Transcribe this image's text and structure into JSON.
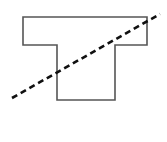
{
  "diagram": {
    "type": "geometry",
    "shape": {
      "name": "T-shape",
      "points": "23,17 147,17 147,45 115,45 115,100 57,100 57,45 23,45",
      "stroke": "#555555",
      "fill": "none"
    },
    "dashed_line": {
      "x1": 12,
      "y1": 98,
      "x2": 160,
      "y2": 14,
      "stroke": "#111111",
      "dash": "6,4"
    },
    "background": "#ffffff"
  }
}
